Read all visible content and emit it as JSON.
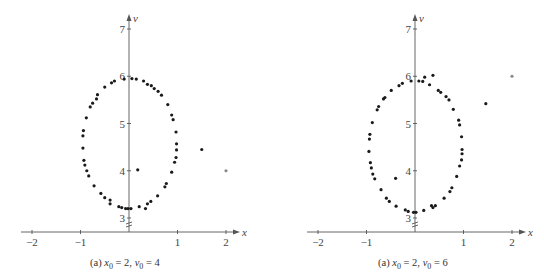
{
  "chart_data": [
    {
      "type": "scatter",
      "title": "",
      "caption": "(a) x0 = 2, v0 = 4",
      "caption_parts": {
        "prefix": "(a) ",
        "xvar": "x",
        "xsub": "0",
        "xval": " = 2, ",
        "vvar": "v",
        "vsub": "0",
        "vval": " = 4"
      },
      "xlabel": "x",
      "ylabel": "v",
      "xlim": [
        -2.3,
        2.3
      ],
      "ylim": [
        2.9,
        7.2
      ],
      "x_ticks": [
        -2,
        -1,
        1,
        2
      ],
      "x_tick_labels": [
        "−2",
        "−1",
        "1",
        "2"
      ],
      "y_ticks": [
        3,
        4,
        5,
        6,
        7
      ],
      "y_tick_labels": [
        "3",
        "4",
        "5",
        "6",
        "7"
      ],
      "y_axis_break": true,
      "grid": false,
      "legend": null,
      "initial_point": {
        "x": 2.0,
        "y": 4.0
      },
      "points": [
        {
          "x": 2.0,
          "y": 4.0,
          "faint": true
        },
        {
          "x": 1.5,
          "y": 4.45
        },
        {
          "x": 0.18,
          "y": 4.02
        },
        {
          "x": -0.95,
          "y": 4.48
        },
        {
          "x": -0.95,
          "y": 4.74
        },
        {
          "x": -0.94,
          "y": 4.85
        },
        {
          "x": -0.88,
          "y": 5.12
        },
        {
          "x": -0.8,
          "y": 5.35
        },
        {
          "x": -0.75,
          "y": 5.43
        },
        {
          "x": -0.67,
          "y": 5.52
        },
        {
          "x": -0.65,
          "y": 5.61
        },
        {
          "x": -0.5,
          "y": 5.77
        },
        {
          "x": -0.36,
          "y": 5.86
        },
        {
          "x": -0.3,
          "y": 5.9
        },
        {
          "x": -0.1,
          "y": 5.94
        },
        {
          "x": 0.06,
          "y": 5.95
        },
        {
          "x": 0.15,
          "y": 5.94
        },
        {
          "x": 0.3,
          "y": 5.9
        },
        {
          "x": 0.38,
          "y": 5.83
        },
        {
          "x": 0.46,
          "y": 5.8
        },
        {
          "x": 0.52,
          "y": 5.74
        },
        {
          "x": 0.6,
          "y": 5.68
        },
        {
          "x": 0.67,
          "y": 5.6
        },
        {
          "x": 0.8,
          "y": 5.4
        },
        {
          "x": 0.88,
          "y": 5.18
        },
        {
          "x": 0.91,
          "y": 5.08
        },
        {
          "x": 0.97,
          "y": 4.82
        },
        {
          "x": 0.98,
          "y": 4.57
        },
        {
          "x": 0.98,
          "y": 4.44
        },
        {
          "x": 0.97,
          "y": 4.28
        },
        {
          "x": 0.94,
          "y": 4.18
        },
        {
          "x": 0.88,
          "y": 3.97
        },
        {
          "x": 0.77,
          "y": 3.73
        },
        {
          "x": 0.74,
          "y": 3.66
        },
        {
          "x": 0.59,
          "y": 3.47
        },
        {
          "x": 0.45,
          "y": 3.35
        },
        {
          "x": 0.38,
          "y": 3.3
        },
        {
          "x": 0.34,
          "y": 3.2
        },
        {
          "x": 0.21,
          "y": 3.24
        },
        {
          "x": 0.04,
          "y": 3.2
        },
        {
          "x": -0.02,
          "y": 3.2
        },
        {
          "x": -0.07,
          "y": 3.2
        },
        {
          "x": -0.15,
          "y": 3.22
        },
        {
          "x": -0.21,
          "y": 3.24
        },
        {
          "x": -0.39,
          "y": 3.3
        },
        {
          "x": -0.39,
          "y": 3.38
        },
        {
          "x": -0.5,
          "y": 3.43
        },
        {
          "x": -0.58,
          "y": 3.52
        },
        {
          "x": -0.72,
          "y": 3.68
        },
        {
          "x": -0.83,
          "y": 3.89
        },
        {
          "x": -0.87,
          "y": 4.0
        },
        {
          "x": -0.91,
          "y": 4.12
        },
        {
          "x": -0.93,
          "y": 4.22
        }
      ]
    },
    {
      "type": "scatter",
      "title": "",
      "caption": "(a) x0 = 2, v0 = 6",
      "caption_parts": {
        "prefix": "(a) ",
        "xvar": "x",
        "xsub": "0",
        "xval": " = 2, ",
        "vvar": "v",
        "vsub": "0",
        "vval": " = 6"
      },
      "xlabel": "x",
      "ylabel": "v",
      "xlim": [
        -2.3,
        2.3
      ],
      "ylim": [
        2.9,
        7.2
      ],
      "x_ticks": [
        -2,
        -1,
        1,
        2
      ],
      "x_tick_labels": [
        "−2",
        "−1",
        "1",
        "2"
      ],
      "y_ticks": [
        3,
        4,
        5,
        6,
        7
      ],
      "y_tick_labels": [
        "3",
        "4",
        "5",
        "6",
        "7"
      ],
      "y_axis_break": true,
      "grid": false,
      "legend": null,
      "initial_point": {
        "x": 2.0,
        "y": 6.0
      },
      "points": [
        {
          "x": 2.0,
          "y": 6.0,
          "faint": true
        },
        {
          "x": 1.46,
          "y": 5.42
        },
        {
          "x": -0.4,
          "y": 3.84
        },
        {
          "x": 0.37,
          "y": 6.02
        },
        {
          "x": 0.2,
          "y": 5.98
        },
        {
          "x": 0.16,
          "y": 5.89
        },
        {
          "x": 0.08,
          "y": 5.9
        },
        {
          "x": -0.08,
          "y": 5.9
        },
        {
          "x": -0.26,
          "y": 5.85
        },
        {
          "x": -0.33,
          "y": 5.8
        },
        {
          "x": -0.49,
          "y": 5.7
        },
        {
          "x": -0.62,
          "y": 5.55
        },
        {
          "x": -0.65,
          "y": 5.52
        },
        {
          "x": -0.75,
          "y": 5.36
        },
        {
          "x": -0.78,
          "y": 5.29
        },
        {
          "x": -0.88,
          "y": 5.02
        },
        {
          "x": -0.93,
          "y": 4.77
        },
        {
          "x": -0.94,
          "y": 4.67
        },
        {
          "x": -0.95,
          "y": 4.41
        },
        {
          "x": -0.92,
          "y": 4.17
        },
        {
          "x": -0.9,
          "y": 4.06
        },
        {
          "x": -0.87,
          "y": 3.93
        },
        {
          "x": -0.83,
          "y": 3.83
        },
        {
          "x": -0.7,
          "y": 3.6
        },
        {
          "x": -0.59,
          "y": 3.42
        },
        {
          "x": -0.53,
          "y": 3.35
        },
        {
          "x": -0.39,
          "y": 3.25
        },
        {
          "x": -0.2,
          "y": 3.17
        },
        {
          "x": -0.14,
          "y": 3.14
        },
        {
          "x": -0.03,
          "y": 3.12
        },
        {
          "x": 0.02,
          "y": 3.12
        },
        {
          "x": 0.18,
          "y": 3.16
        },
        {
          "x": 0.34,
          "y": 3.26
        },
        {
          "x": 0.37,
          "y": 3.22
        },
        {
          "x": 0.42,
          "y": 3.26
        },
        {
          "x": 0.6,
          "y": 3.42
        },
        {
          "x": 0.72,
          "y": 3.56
        },
        {
          "x": 0.76,
          "y": 3.64
        },
        {
          "x": 0.86,
          "y": 3.88
        },
        {
          "x": 0.92,
          "y": 4.1
        },
        {
          "x": 0.96,
          "y": 4.23
        },
        {
          "x": 0.97,
          "y": 4.36
        },
        {
          "x": 0.97,
          "y": 4.45
        },
        {
          "x": 0.96,
          "y": 4.72
        },
        {
          "x": 0.92,
          "y": 4.97
        },
        {
          "x": 0.9,
          "y": 5.07
        },
        {
          "x": 0.79,
          "y": 5.3
        },
        {
          "x": 0.7,
          "y": 5.5
        },
        {
          "x": 0.64,
          "y": 5.57
        },
        {
          "x": 0.53,
          "y": 5.66
        },
        {
          "x": 0.48,
          "y": 5.7
        },
        {
          "x": 0.3,
          "y": 5.82
        }
      ]
    }
  ]
}
